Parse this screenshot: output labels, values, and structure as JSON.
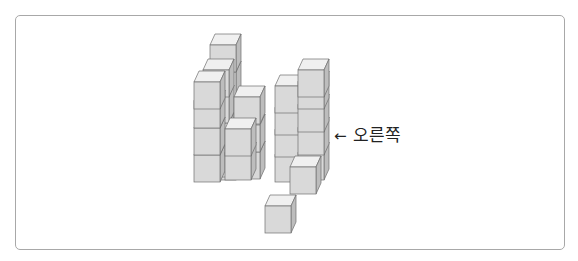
{
  "figure": {
    "label": {
      "arrow": "←",
      "text": "오른쪽"
    },
    "colors": {
      "front": "#d9d9d9",
      "top": "#f0f0f0",
      "side": "#bdbdbd",
      "edge": "#6f6f6f",
      "border": "#a8a8a8"
    },
    "structures": [
      {
        "name": "left-structure",
        "cube_count": 11
      },
      {
        "name": "right-structure",
        "cube_count": 9
      },
      {
        "name": "single-cube",
        "cube_count": 1
      }
    ]
  }
}
